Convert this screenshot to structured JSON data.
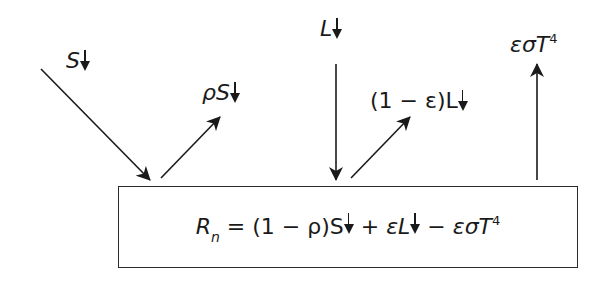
{
  "diagram": {
    "labels": {
      "incoming_shortwave": {
        "symbol": "S",
        "direction": "↓"
      },
      "reflected_shortwave": {
        "prefix": "ρ",
        "symbol": "S",
        "direction": "↓"
      },
      "incoming_longwave": {
        "symbol": "L",
        "direction": "↓"
      },
      "reflected_longwave": {
        "prefix": "(1 − ε)",
        "symbol": "L",
        "direction": "↓"
      },
      "emitted_longwave": {
        "text": "εσT",
        "exponent": "4"
      }
    },
    "equation": {
      "lhs": "R",
      "lhs_subscript": "n",
      "equals": " = ",
      "term1": "(1 − ρ)S",
      "plus": " + ",
      "term2": "εL",
      "minus": " − ",
      "term3": "εσT",
      "term3_exponent": "4"
    },
    "colors": {
      "ink": "#1a1a1a",
      "background": "#ffffff"
    }
  }
}
